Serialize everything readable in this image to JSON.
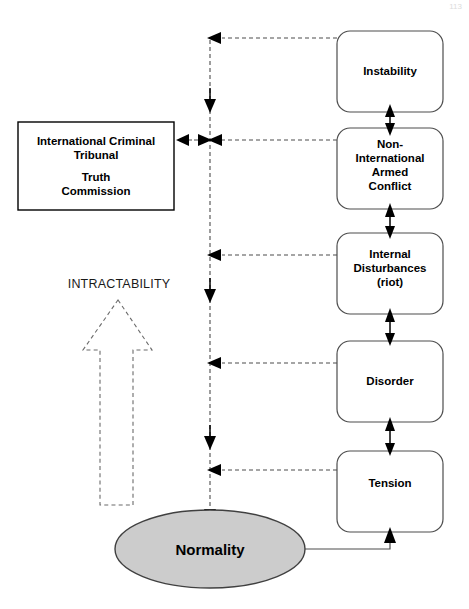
{
  "page": {
    "page_number": "113"
  },
  "nodes": {
    "tribunal_box": {
      "lines": [
        "International Criminal",
        "Tribunal",
        "",
        "Truth",
        "Commission"
      ],
      "shape": "rectangle",
      "fill": "#ffffff"
    },
    "ladder": [
      {
        "id": "instability",
        "lines": [
          "Instability"
        ]
      },
      {
        "id": "non-international-armed-conflict",
        "lines": [
          "Non-",
          "International",
          "Armed",
          "Conflict"
        ]
      },
      {
        "id": "internal-disturbances",
        "lines": [
          "Internal",
          "Disturbances",
          "(riot)"
        ]
      },
      {
        "id": "disorder",
        "lines": [
          "Disorder"
        ]
      },
      {
        "id": "tension",
        "lines": [
          "Tension"
        ]
      }
    ],
    "normality": {
      "label": "Normality",
      "shape": "ellipse",
      "fill": "#cccccc"
    }
  },
  "annotations": {
    "intractability_axis": "INTRACTABILITY"
  },
  "colors": {
    "box_stroke": "#4d4d4d",
    "hard_stroke": "#000000",
    "ellipse_fill": "#cccccc",
    "dashed_stroke": "#4d4d4d",
    "background": "#ffffff"
  }
}
